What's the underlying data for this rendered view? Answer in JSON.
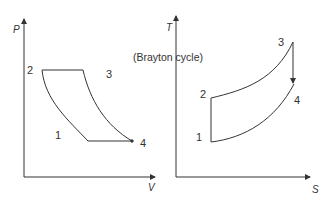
{
  "caption": "(Brayton cycle)",
  "pv_diagram": {
    "y_axis_label": "P",
    "x_axis_label": "V",
    "points": [
      {
        "label": "1",
        "x": 88,
        "y": 141
      },
      {
        "label": "2",
        "x": 42,
        "y": 70
      },
      {
        "label": "3",
        "x": 83,
        "y": 70
      },
      {
        "label": "4",
        "x": 132,
        "y": 141
      }
    ],
    "point_labels": {
      "p1": "1",
      "p2": "2",
      "p3": "3",
      "p4": "4"
    }
  },
  "ts_diagram": {
    "y_axis_label": "T",
    "x_axis_label": "S",
    "points": [
      {
        "label": "1",
        "x": 211,
        "y": 142
      },
      {
        "label": "2",
        "x": 211,
        "y": 98
      },
      {
        "label": "3",
        "x": 293,
        "y": 42
      },
      {
        "label": "4",
        "x": 294,
        "y": 84
      }
    ],
    "point_labels": {
      "p1": "1",
      "p2": "2",
      "p3": "3",
      "p4": "4"
    }
  },
  "colors": {
    "line": "#333333",
    "background": "#ffffff"
  }
}
